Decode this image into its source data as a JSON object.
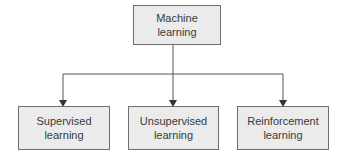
{
  "diagram": {
    "root": {
      "label": "Machine\nlearning"
    },
    "children": [
      {
        "label": "Supervised\nlearning"
      },
      {
        "label": "Unsupervised\nlearning"
      },
      {
        "label": "Reinforcement\nlearning"
      }
    ],
    "colors": {
      "box_fill": "#ebebeb",
      "border": "#6e6e6e",
      "text": "#3a3a3a",
      "line": "#555555"
    }
  }
}
